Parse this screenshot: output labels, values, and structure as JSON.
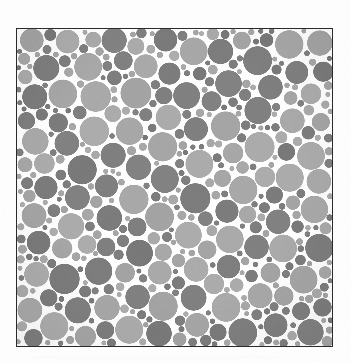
{
  "figure": {
    "title": "Random circle packing plate",
    "description": "Dense random packing of non-overlapping discs of varying radii, each shaded one of two gray tones, on a white background inside a thin rectangular black frame.",
    "caption": ""
  },
  "page": {
    "background_color": "#fdfdfd",
    "width": 351,
    "height": 363,
    "margin_top": 28,
    "margin_left": 16,
    "margin_right": 18,
    "margin_bottom": 16
  },
  "plate": {
    "x": 16,
    "y": 28,
    "width": 317,
    "height": 319,
    "border_color": "#2b2b2b",
    "border_width": 1,
    "background_color": "#fbfbfb"
  },
  "chart_data": {
    "type": "scatter",
    "title": "Random circle packing plate",
    "xlabel": "",
    "ylabel": "",
    "xlim": [
      0,
      317
    ],
    "ylim": [
      0,
      319
    ],
    "grid": false,
    "legend": "none",
    "marker": "circle",
    "tones": [
      {
        "name": "dark-gray",
        "hex": "#7e7e7e",
        "share": 0.5
      },
      {
        "name": "light-gray",
        "hex": "#a9a9a9",
        "share": 0.5
      }
    ],
    "radius_range": [
      2,
      15
    ],
    "approx_circle_count": 620,
    "packing_fraction": 0.72,
    "seed": 20240517,
    "background": "#ffffff"
  }
}
